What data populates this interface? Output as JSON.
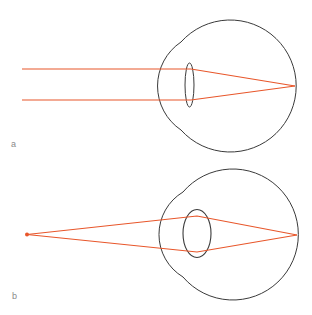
{
  "figure": {
    "panels": [
      {
        "label": "a",
        "description": "Distant object: parallel rays focused onto retina by thin (relaxed) lens",
        "rays": {
          "start_x": 22,
          "top_y": 69,
          "bottom_y": 100,
          "focus": [
            295,
            86
          ]
        },
        "lens": {
          "cx": 189.5,
          "cy": 85,
          "rx": 4.5,
          "ry": 22
        }
      },
      {
        "label": "b",
        "description": "Near point source: diverging rays focused onto retina by thick (accommodated) lens",
        "rays": {
          "source": [
            27,
            234.5
          ],
          "lens_top": [
            197,
            216
          ],
          "lens_bottom": [
            197,
            252
          ],
          "focus": [
            297,
            235
          ]
        },
        "lens": {
          "cx": 197,
          "cy": 233.5,
          "rx": 14,
          "ry": 24
        }
      }
    ],
    "colors": {
      "ray": "#e8562a",
      "outline": "#3a3a3a",
      "label": "#8a8a8a"
    }
  }
}
